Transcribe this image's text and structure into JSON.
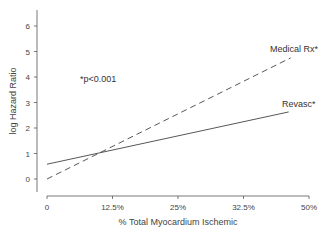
{
  "chart_data": {
    "type": "line",
    "title": "",
    "xlabel": "% Total Myocardium Ischemic",
    "ylabel": "log Hazard Ratio",
    "x_tick_labels": [
      "0",
      "12.5%",
      "25%",
      "32.5%",
      "50%"
    ],
    "y_tick_labels": [
      "0",
      "1",
      "2",
      "3",
      "4",
      "5",
      "6"
    ],
    "ylim": [
      -0.5,
      6.8
    ],
    "grid": false,
    "annotation": "*p<0.001",
    "series": [
      {
        "name": "Medical Rx*",
        "style": "dashed",
        "x_pos": [
          0,
          3.72
        ],
        "values": [
          0.0,
          4.75
        ]
      },
      {
        "name": "Revasc*",
        "style": "solid",
        "x_pos": [
          0,
          3.69
        ],
        "values": [
          0.58,
          2.63
        ]
      }
    ],
    "crossing_point": {
      "x_pos": 0.75,
      "value": 1.0
    }
  }
}
